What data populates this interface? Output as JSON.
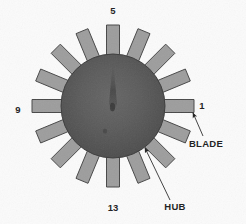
{
  "figure": {
    "background_color": "#fbfbfb",
    "hub": {
      "center_x": 113,
      "center_y": 106,
      "radius": 52,
      "fill_outer": "#5f5f5f",
      "fill_inner": "#4a4a4a",
      "stroke": "#3a3a3a"
    },
    "blade": {
      "count": 16,
      "inner_radius": 44,
      "outer_radius": 81,
      "half_width": 6.5,
      "fill": "#9d9d9d",
      "stroke": "#474747",
      "angle_step_deg": 22.5
    },
    "position_labels": [
      {
        "name": "position-1",
        "text": "1",
        "x": 202,
        "y": 106,
        "blade_index": 0
      },
      {
        "name": "position-5",
        "text": "5",
        "x": 113,
        "y": 11,
        "blade_index": 4
      },
      {
        "name": "position-9",
        "text": "9",
        "x": 18,
        "y": 110,
        "blade_index": 8
      },
      {
        "name": "position-13",
        "text": "13",
        "x": 113,
        "y": 208,
        "blade_index": 12
      }
    ],
    "callouts": [
      {
        "name": "blade-callout",
        "text": "BLADE",
        "label_x": 206,
        "label_y": 144,
        "arrow_tip_x": 193,
        "arrow_tip_y": 113,
        "leader_from_x": 203,
        "leader_from_y": 136
      },
      {
        "name": "hub-callout",
        "text": "HUB",
        "label_x": 175,
        "label_y": 207,
        "arrow_tip_x": 145,
        "arrow_tip_y": 148,
        "leader_from_x": 170,
        "leader_from_y": 200
      }
    ]
  }
}
